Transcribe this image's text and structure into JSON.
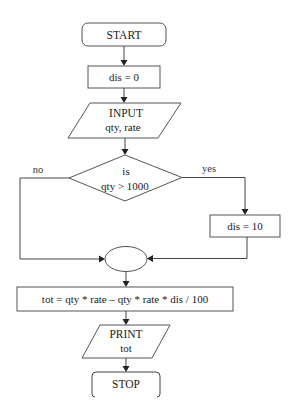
{
  "flowchart": {
    "start": {
      "label": "START"
    },
    "init": {
      "label": "dis = 0"
    },
    "input": {
      "line1": "INPUT",
      "line2": "qty, rate"
    },
    "decision": {
      "line1": "is",
      "line2": "qty > 1000"
    },
    "branch_no": {
      "label": "no"
    },
    "branch_yes": {
      "label": "yes"
    },
    "set_discount": {
      "label": "dis = 10"
    },
    "connector": {
      "label": ""
    },
    "compute": {
      "label": "tot = qty * rate – qty * rate * dis / 100"
    },
    "output": {
      "line1": "PRINT",
      "line2": "tot"
    },
    "stop": {
      "label": "STOP"
    }
  },
  "colors": {
    "stroke": "#555555",
    "arrow": "#222222",
    "text": "#222222",
    "background": "#ffffff"
  }
}
